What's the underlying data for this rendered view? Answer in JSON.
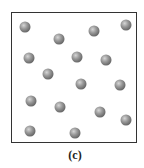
{
  "figure": {
    "caption": "(c)",
    "particle_count": 16,
    "particles": [
      {
        "x": 25,
        "y": 27
      },
      {
        "x": 59,
        "y": 39
      },
      {
        "x": 94,
        "y": 31
      },
      {
        "x": 126,
        "y": 25
      },
      {
        "x": 29,
        "y": 58
      },
      {
        "x": 77,
        "y": 57
      },
      {
        "x": 106,
        "y": 60
      },
      {
        "x": 48,
        "y": 74
      },
      {
        "x": 81,
        "y": 84
      },
      {
        "x": 120,
        "y": 85
      },
      {
        "x": 31,
        "y": 101
      },
      {
        "x": 60,
        "y": 107
      },
      {
        "x": 100,
        "y": 112
      },
      {
        "x": 126,
        "y": 120
      },
      {
        "x": 30,
        "y": 131
      },
      {
        "x": 75,
        "y": 133
      }
    ],
    "colors": {
      "border": "#333333",
      "particle": "#7a7a7a",
      "background": "#ffffff"
    }
  }
}
